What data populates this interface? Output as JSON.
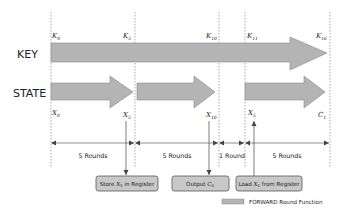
{
  "rows": {
    "key_label": "KEY",
    "state_label": "STATE"
  },
  "key_labels": [
    {
      "base": "K",
      "sub": "0"
    },
    {
      "base": "K",
      "sub": "5"
    },
    {
      "base": "K",
      "sub": "10"
    },
    {
      "base": "K",
      "sub": "11"
    },
    {
      "base": "K",
      "sub": "16"
    }
  ],
  "state_labels": [
    {
      "base": "X",
      "sub": "0"
    },
    {
      "base": "X",
      "sub": "5"
    },
    {
      "base": "X",
      "sub": "10"
    },
    {
      "base": "X",
      "sub": "5"
    },
    {
      "base": "C",
      "sub": "1"
    }
  ],
  "intervals": [
    {
      "label": "5 Rounds"
    },
    {
      "label": "5 Rounds"
    },
    {
      "label": "1 Round"
    },
    {
      "label": "5 Rounds"
    }
  ],
  "boxes": [
    {
      "pre": "Store ",
      "var": "X",
      "sub": "5",
      "post": " in Register"
    },
    {
      "pre": "Output ",
      "var": "C",
      "sub": "0",
      "post": ""
    },
    {
      "pre": "Load ",
      "var": "X",
      "sub": "5",
      "post": " from Register"
    }
  ],
  "legend": {
    "label": "FORWARD Round Function",
    "color": "#b4b4b4"
  },
  "colors": {
    "arrow_fill": "#b4b4b4",
    "arrow_stroke": "#8a8a8a",
    "box_fill": "#c8c8c8",
    "box_stroke": "#555555",
    "line": "#555555"
  }
}
